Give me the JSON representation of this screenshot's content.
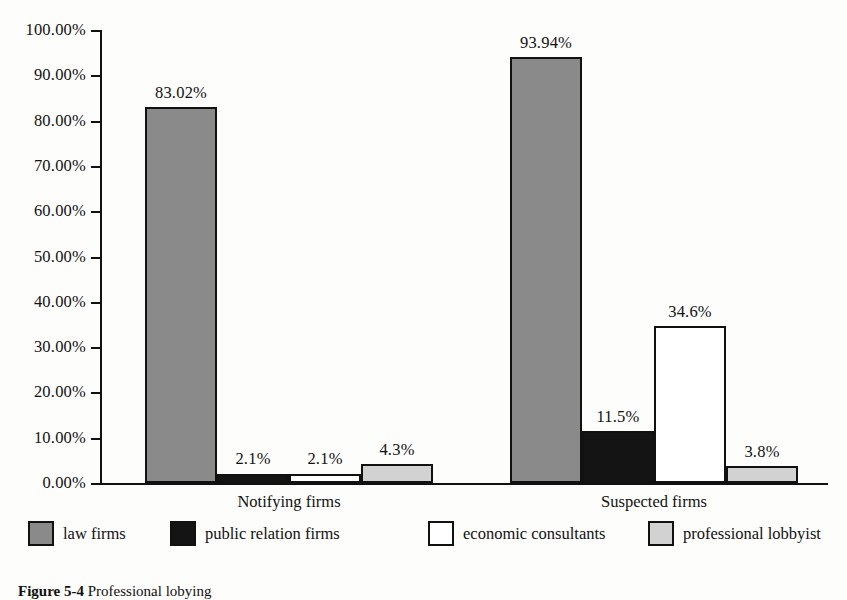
{
  "caption": {
    "label": "Figure 5-4",
    "text": "Professional lobying"
  },
  "chart_data": {
    "type": "bar",
    "title": "",
    "xlabel": "",
    "ylabel": "",
    "grid": false,
    "legend_position": "bottom",
    "ylim": [
      0,
      100
    ],
    "ytick_labels": [
      "100.00%",
      "90.00%",
      "80.00%",
      "70.00%",
      "60.00%",
      "50.00%",
      "40.00%",
      "30.00%",
      "20.00%",
      "10.00%",
      "0.00%"
    ],
    "ytick_values": [
      100,
      90,
      80,
      70,
      60,
      50,
      40,
      30,
      20,
      10,
      0
    ],
    "categories": [
      "Notifying firms",
      "Suspected firms"
    ],
    "series": [
      {
        "name": "law firms",
        "color": "#8a8a8a",
        "values": [
          83.02,
          93.94
        ],
        "labels": [
          "83.02%",
          "93.94%"
        ]
      },
      {
        "name": "public relation firms",
        "color": "#141414",
        "values": [
          2.1,
          11.5
        ],
        "labels": [
          "2.1%",
          "11.5%"
        ]
      },
      {
        "name": "economic consultants",
        "color": "#ffffff",
        "values": [
          2.1,
          34.6
        ],
        "labels": [
          "2.1%",
          "34.6%"
        ]
      },
      {
        "name": "professional lobbyist",
        "color": "#d2d2d2",
        "values": [
          4.3,
          3.8
        ],
        "labels": [
          "4.3%",
          "3.8%"
        ]
      }
    ]
  }
}
